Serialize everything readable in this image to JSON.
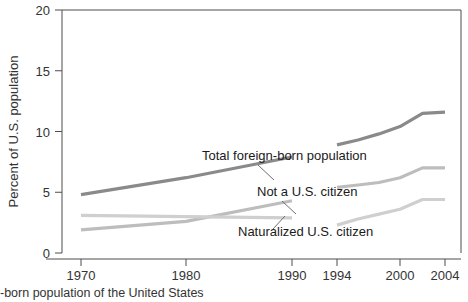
{
  "chart_data": {
    "type": "line",
    "title": "",
    "xlabel": "Year",
    "ylabel": "Percent of U.S. population",
    "xlim": [
      1968,
      2006
    ],
    "ylim": [
      0,
      20
    ],
    "yticks": [
      0,
      5,
      10,
      15,
      20
    ],
    "ytick_labels": [
      "0",
      "5",
      "10",
      "15",
      "20"
    ],
    "xticks": [
      1970,
      1980,
      1990,
      1994,
      2000,
      2004
    ],
    "xtick_labels": [
      "1970",
      "1980",
      "1990",
      "1994",
      "2000",
      "2004"
    ],
    "grid": false,
    "legend": "inline-annotations",
    "note": "Each series is drawn as two separate segments: decennial census 1970-1990 and annual survey 1994-2004",
    "series": [
      {
        "name": "Total foreign-born population",
        "color": "#8a8a8a",
        "segments": [
          {
            "x": [
              1970,
              1980,
              1990
            ],
            "y": [
              4.8,
              6.2,
              7.9
            ]
          },
          {
            "x": [
              1994,
              1996,
              1998,
              2000,
              2002,
              2004
            ],
            "y": [
              8.9,
              9.3,
              9.8,
              10.4,
              11.5,
              11.6
            ]
          }
        ]
      },
      {
        "name": "Not a U.S. citizen",
        "color": "#bdbdbd",
        "segments": [
          {
            "x": [
              1970,
              1980,
              1990
            ],
            "y": [
              1.9,
              2.6,
              4.3
            ]
          },
          {
            "x": [
              1994,
              1996,
              1998,
              2000,
              2002,
              2004
            ],
            "y": [
              5.4,
              5.6,
              5.8,
              6.2,
              7.0,
              7.0
            ]
          }
        ]
      },
      {
        "name": "Naturalized U.S. citizen",
        "color": "#cfcfcf",
        "segments": [
          {
            "x": [
              1970,
              1980,
              1990
            ],
            "y": [
              3.1,
              3.0,
              2.9
            ]
          },
          {
            "x": [
              1994,
              1996,
              1998,
              2000,
              2002,
              2004
            ],
            "y": [
              2.3,
              2.8,
              3.2,
              3.6,
              4.4,
              4.4
            ]
          }
        ]
      }
    ],
    "annotations": [
      {
        "text": "Total foreign-born population",
        "label_x": 202,
        "label_y": 160,
        "leader": [
          258,
          165,
          274,
          180
        ]
      },
      {
        "text": "Not a U.S. citizen",
        "label_x": 257,
        "label_y": 196,
        "leader": [
          282,
          201,
          296,
          214
        ]
      },
      {
        "text": "Naturalized U.S. citizen",
        "label_x": 238,
        "label_y": 236,
        "leader": [
          273,
          229,
          285,
          216
        ]
      }
    ]
  },
  "caption": {
    "text": "-born population of the United States"
  }
}
